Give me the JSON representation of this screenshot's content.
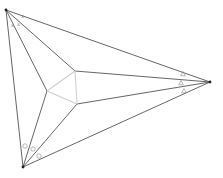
{
  "diagram": {
    "colors": {
      "edge": "#555555",
      "morley": "#cfcfcf",
      "vertex": "#222222",
      "marks": "#888888"
    },
    "vertices": {
      "A": [
        6,
        10
      ],
      "B": [
        210,
        82
      ],
      "C": [
        23,
        167
      ]
    },
    "morley_points": {
      "P1": [
        75,
        71
      ],
      "P2": [
        47,
        91
      ],
      "P3": [
        77,
        104
      ]
    },
    "angle_marks": {
      "A": {
        "symbol": "x",
        "positions": [
          [
            21,
            18
          ],
          [
            17,
            26
          ],
          [
            11,
            27
          ]
        ]
      },
      "B": {
        "symbol": "△",
        "positions": [
          [
            183,
            74
          ],
          [
            181,
            83
          ],
          [
            184,
            91
          ]
        ]
      },
      "C": {
        "symbol": "○",
        "positions": [
          [
            25,
            146
          ],
          [
            33,
            149
          ],
          [
            39,
            156
          ]
        ]
      }
    }
  }
}
